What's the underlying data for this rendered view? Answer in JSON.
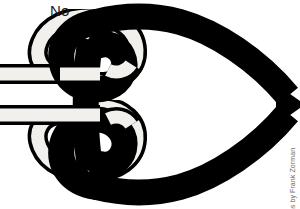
{
  "figure": {
    "title": "No",
    "caption_label": "No",
    "credit": "Knot Illustrations by Frank Zorman",
    "width": 300,
    "height": 209,
    "background_color": "#ffffff",
    "rope_dark_color": "#000000",
    "rope_light_fill": "#f2f0ec",
    "rope_light_outline": "#000000",
    "label_color": "#1a1a1a",
    "credit_color": "#6a6a6a"
  },
  "diagram": {
    "kind": "knot-illustration",
    "verdict": "No",
    "elements": [
      {
        "name": "dark-rope-bight",
        "color": "#000000",
        "style": "solid",
        "role": "standing-rope forming a large pointed bight toward the right"
      },
      {
        "name": "light-rope-upper-tail",
        "color": "#f2f0ec",
        "style": "outlined",
        "role": "upper working end entering from the left edge"
      },
      {
        "name": "light-rope-lower-tail",
        "color": "#f2f0ec",
        "style": "outlined",
        "role": "lower working end entering from the left edge"
      },
      {
        "name": "light-rope-upper-loop",
        "color": "#f2f0ec",
        "style": "outlined",
        "role": "upper loop wrapping the dark rope"
      },
      {
        "name": "light-rope-lower-loop",
        "color": "#f2f0ec",
        "style": "outlined",
        "role": "lower loop wrapping the dark rope"
      }
    ]
  }
}
